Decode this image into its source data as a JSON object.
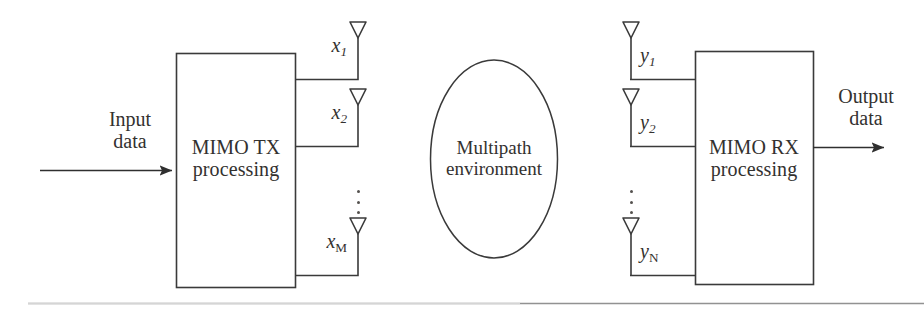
{
  "figure": {
    "line_color": "#3a3a3a",
    "text_color": "#33312f",
    "background": "#ffffff"
  },
  "transmitter": {
    "block_label_line1": "MIMO TX",
    "block_label_line2": "processing",
    "input_label_line1": "Input",
    "input_label_line2": "data",
    "antennas": [
      {
        "symbol": "x",
        "index": "1"
      },
      {
        "symbol": "x",
        "index": "2"
      },
      {
        "symbol": "x",
        "index": "M"
      }
    ],
    "ellipsis": "⋮"
  },
  "channel": {
    "label_line1": "Multipath",
    "label_line2": "environment"
  },
  "receiver": {
    "block_label_line1": "MIMO RX",
    "block_label_line2": "processing",
    "output_label_line1": "Output",
    "output_label_line2": "data",
    "antennas": [
      {
        "symbol": "y",
        "index": "1"
      },
      {
        "symbol": "y",
        "index": "2"
      },
      {
        "symbol": "y",
        "index": "N"
      }
    ],
    "ellipsis": "⋮"
  }
}
